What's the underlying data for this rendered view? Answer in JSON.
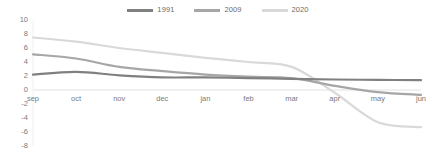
{
  "chart_data": {
    "type": "line",
    "title": "",
    "xlabel": "",
    "ylabel": "",
    "categories": [
      "sep",
      "oct",
      "nov",
      "dec",
      "jan",
      "feb",
      "mar",
      "apr",
      "may",
      "jun"
    ],
    "ylim": [
      -8,
      10
    ],
    "yticks": [
      10,
      8,
      6,
      4,
      2,
      0,
      -2,
      -4,
      -6,
      -8
    ],
    "grid": false,
    "legend_position": "top-center",
    "series": [
      {
        "name": "1991",
        "color": "#808080",
        "values": [
          2.2,
          2.6,
          2.1,
          1.8,
          1.8,
          1.7,
          1.6,
          1.5,
          1.45,
          1.4
        ]
      },
      {
        "name": "2009",
        "color": "#a6a6a6",
        "values": [
          5.1,
          4.5,
          3.3,
          2.7,
          2.2,
          1.9,
          1.7,
          0.6,
          -0.3,
          -0.7
        ]
      },
      {
        "name": "2020",
        "color": "#d9d9d9",
        "values": [
          7.5,
          6.9,
          6.0,
          5.3,
          4.6,
          4.0,
          3.3,
          -0.4,
          -4.6,
          -5.3
        ]
      }
    ]
  },
  "legend": {
    "entries": [
      {
        "label": "1991"
      },
      {
        "label": "2009"
      },
      {
        "label": "2020"
      }
    ]
  }
}
